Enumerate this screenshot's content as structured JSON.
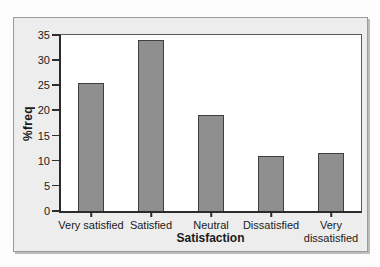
{
  "figure_style": {
    "frame_background": "#ededed",
    "plot_background": "#ffffff",
    "bar_fill": "#8f8f8f",
    "bar_border": "#3f3f3f",
    "axis_color": "#2e2e2e",
    "text_color": "#1a1a1a"
  },
  "chart_data": {
    "type": "bar",
    "categories": [
      "Very satisfied",
      "Satisfied",
      "Neutral",
      "Dissatisfied",
      "Very dissatisfied"
    ],
    "values": [
      25.5,
      34,
      19,
      11,
      11.5
    ],
    "xlabel": "Satisfaction",
    "ylabel": "%freq",
    "ylim": [
      0,
      35
    ],
    "yticks": [
      0,
      5,
      10,
      15,
      20,
      25,
      30,
      35
    ],
    "grid": false,
    "legend": "none",
    "bar_slot_fraction": 0.43
  }
}
